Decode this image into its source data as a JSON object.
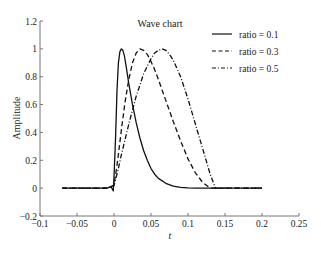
{
  "chart_data": {
    "type": "line",
    "title": "Wave chart",
    "xlabel": "t",
    "ylabel": "Amplitude",
    "xlim": [
      -0.1,
      0.25
    ],
    "ylim": [
      -0.2,
      1.2
    ],
    "xticks": [
      -0.1,
      -0.05,
      0,
      0.05,
      0.1,
      0.15,
      0.2,
      0.25
    ],
    "xtick_labels": [
      "−0.1",
      "−0.05",
      "0",
      "0.05",
      "0.1",
      "0.15",
      "0.2",
      "0.25"
    ],
    "yticks": [
      -0.2,
      0,
      0.2,
      0.4,
      0.6,
      0.8,
      1,
      1.2
    ],
    "ytick_labels": [
      "−0.2",
      "0",
      "0.2",
      "0.4",
      "0.6",
      "0.8",
      "1",
      "1.2"
    ],
    "grid": false,
    "legend_position": "top-right",
    "series": [
      {
        "name": "ratio = 0.1",
        "style": "solid",
        "x": [
          -0.07,
          -0.05,
          -0.03,
          -0.01,
          -0.004,
          -0.001,
          0.0,
          0.002,
          0.004,
          0.006,
          0.008,
          0.01,
          0.012,
          0.014,
          0.016,
          0.018,
          0.02,
          0.025,
          0.03,
          0.035,
          0.04,
          0.045,
          0.05,
          0.055,
          0.06,
          0.07,
          0.08,
          0.09,
          0.1,
          0.11,
          0.13,
          0.15,
          0.2
        ],
        "y": [
          0,
          0,
          0,
          0,
          0.01,
          -0.02,
          0.08,
          0.35,
          0.7,
          0.9,
          0.98,
          1.0,
          0.99,
          0.95,
          0.89,
          0.82,
          0.75,
          0.6,
          0.47,
          0.36,
          0.27,
          0.2,
          0.14,
          0.1,
          0.07,
          0.035,
          0.015,
          0.006,
          0.002,
          0.0,
          0,
          0,
          0
        ]
      },
      {
        "name": "ratio = 0.3",
        "style": "dashed",
        "x": [
          -0.07,
          -0.01,
          0.0,
          0.005,
          0.01,
          0.015,
          0.02,
          0.025,
          0.03,
          0.035,
          0.04,
          0.045,
          0.05,
          0.055,
          0.06,
          0.07,
          0.08,
          0.09,
          0.1,
          0.11,
          0.12,
          0.13,
          0.14,
          0.2
        ],
        "y": [
          0,
          0,
          0.02,
          0.2,
          0.42,
          0.62,
          0.78,
          0.9,
          0.97,
          1.0,
          0.99,
          0.96,
          0.91,
          0.85,
          0.78,
          0.63,
          0.48,
          0.34,
          0.21,
          0.11,
          0.04,
          0.0,
          0,
          0
        ]
      },
      {
        "name": "ratio = 0.5",
        "style": "dashdot",
        "x": [
          -0.07,
          -0.01,
          0.0,
          0.005,
          0.01,
          0.02,
          0.03,
          0.04,
          0.05,
          0.055,
          0.06,
          0.065,
          0.07,
          0.075,
          0.08,
          0.09,
          0.1,
          0.11,
          0.12,
          0.13,
          0.137,
          0.15,
          0.2
        ],
        "y": [
          0,
          0,
          0.02,
          0.12,
          0.24,
          0.46,
          0.66,
          0.82,
          0.93,
          0.97,
          0.99,
          1.0,
          0.99,
          0.96,
          0.92,
          0.8,
          0.64,
          0.46,
          0.28,
          0.1,
          0.0,
          0,
          0
        ]
      }
    ]
  }
}
